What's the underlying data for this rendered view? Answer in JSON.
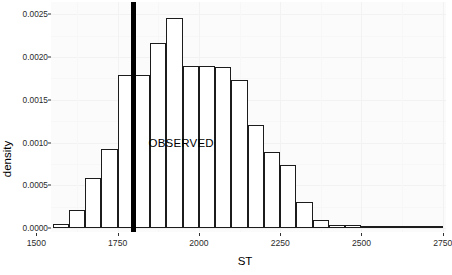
{
  "chart_data": {
    "type": "bar",
    "title": "",
    "subtitle": "",
    "xlabel": "ST",
    "ylabel": "density",
    "xlim": [
      1545,
      2760
    ],
    "ylim": [
      0,
      0.00255
    ],
    "grid": true,
    "legend": null,
    "bin_width": 50,
    "categories": [
      "1550-1600",
      "1600-1650",
      "1650-1700",
      "1700-1750",
      "1750-1800",
      "1800-1850",
      "1850-1900",
      "1900-1950",
      "1950-2000",
      "2000-2050",
      "2050-2100",
      "2100-2150",
      "2150-2200",
      "2200-2250",
      "2250-2300",
      "2300-2350",
      "2350-2400",
      "2400-2450",
      "2450-2500",
      "2500-2550",
      "2550-2600",
      "2600-2650",
      "2650-2700",
      "2700-2750"
    ],
    "bin_starts": [
      1550,
      1600,
      1650,
      1700,
      1750,
      1800,
      1850,
      1900,
      1950,
      2000,
      2050,
      2100,
      2150,
      2200,
      2250,
      2300,
      2350,
      2400,
      2450,
      2500,
      2550,
      2600,
      2650,
      2700
    ],
    "values": [
      5e-05,
      0.00021,
      0.00058,
      0.00092,
      0.00179,
      0.00179,
      0.00216,
      0.00246,
      0.0019,
      0.00189,
      0.00188,
      0.00173,
      0.0012,
      0.00089,
      0.00074,
      0.0003,
      9e-05,
      4e-05,
      3e-05,
      1e-05,
      1e-05,
      1e-05,
      1e-05,
      1e-05
    ],
    "x_ticks": [
      1500,
      1750,
      2000,
      2250,
      2500,
      2750
    ],
    "x_tick_labels": [
      "1500",
      "1750",
      "2000",
      "2250",
      "2500",
      "2750"
    ],
    "y_ticks": [
      0.0,
      0.0005,
      0.001,
      0.0015,
      0.002,
      0.0025
    ],
    "y_tick_labels": [
      "0.0000",
      "0.0005",
      "0.0010",
      "0.0015",
      "0.0020",
      "0.0025"
    ],
    "annotations": [
      {
        "name": "observed-line",
        "type": "vline",
        "x": 1800,
        "label": "OBSERVED",
        "label_x": 1845,
        "label_y": 0.00097,
        "color": "#000000"
      }
    ]
  },
  "colors": {
    "bar_fill": "#ffffff",
    "bar_stroke": "#1c1c1c",
    "panel_background": "#fbfbfb",
    "gridline_major": "#f2f2f2",
    "gridline_minor": "#f7f7f7",
    "axis_text": "#2b2b2b",
    "axis_title": "#000000",
    "annotation": "#000000"
  }
}
